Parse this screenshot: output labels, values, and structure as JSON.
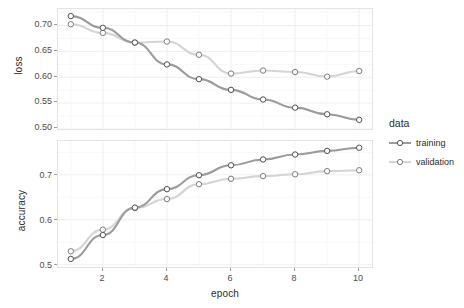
{
  "chart_data": {
    "type": "line",
    "title": "",
    "xlabel": "epoch",
    "x": [
      1,
      2,
      3,
      4,
      5,
      6,
      7,
      8,
      9,
      10
    ],
    "facets": [
      {
        "ylabel": "loss",
        "ylim": [
          0.482,
          0.718
        ],
        "yticks": [
          0.5,
          0.55,
          0.6,
          0.65,
          0.7
        ],
        "ytick_labels": [
          "0.50",
          "0.55",
          "0.60",
          "0.65",
          "0.70"
        ],
        "series": [
          {
            "name": "training",
            "values": [
              0.704,
              0.681,
              0.652,
              0.609,
              0.58,
              0.559,
              0.54,
              0.524,
              0.511,
              0.5
            ]
          },
          {
            "name": "validation",
            "values": [
              0.688,
              0.671,
              0.652,
              0.654,
              0.628,
              0.591,
              0.597,
              0.594,
              0.585,
              0.596
            ]
          }
        ]
      },
      {
        "ylabel": "accuracy",
        "ylim": [
          0.495,
          0.775
        ],
        "yticks": [
          0.5,
          0.6,
          0.7
        ],
        "ytick_labels": [
          "0.5",
          "0.6",
          "0.7"
        ],
        "series": [
          {
            "name": "training",
            "values": [
              0.513,
              0.566,
              0.627,
              0.668,
              0.699,
              0.721,
              0.734,
              0.745,
              0.753,
              0.76
            ]
          },
          {
            "name": "validation",
            "values": [
              0.53,
              0.578,
              0.626,
              0.646,
              0.679,
              0.691,
              0.697,
              0.701,
              0.708,
              0.71
            ]
          }
        ]
      }
    ],
    "xticks": [
      2,
      4,
      6,
      8,
      10
    ],
    "xtick_labels": [
      "2",
      "4",
      "6",
      "8",
      "10"
    ],
    "xlim": [
      0.6,
      10.4
    ],
    "grid": true,
    "legend": {
      "title": "data",
      "position": "right",
      "entries": [
        {
          "label": "training",
          "color": "#9b9b9b"
        },
        {
          "label": "validation",
          "color": "#d4d4d4"
        }
      ]
    }
  },
  "colors": {
    "training": "#9b9b9b",
    "validation": "#d4d4d4",
    "panel_border": "#e3e3e3",
    "grid_major": "#efefef",
    "grid_minor": "#f7f7f7",
    "point_stroke": "#4f4f4f",
    "text": "#2b2b2b",
    "tick_text": "#4d4d4d",
    "background": "#ffffff"
  }
}
